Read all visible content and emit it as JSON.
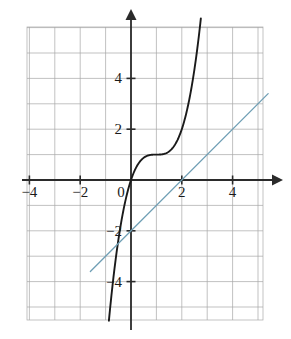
{
  "figure": {
    "title": "",
    "background_color": "#ffffff",
    "grid_color": "#9a9a9a",
    "axis_color": "#2b2b2b",
    "curve_color": "#1a1a1a",
    "line_color": "#6f9fb5"
  },
  "chart_data": {
    "type": "line",
    "title": "",
    "xlabel": "",
    "ylabel": "",
    "xlim": [
      -4.2,
      5.6
    ],
    "ylim": [
      -5.1,
      5.8
    ],
    "grid": true,
    "grid_spacing": 1,
    "legend": "none",
    "x_ticks": [
      -4,
      -2,
      2,
      4
    ],
    "x_tick_labels": [
      "−4",
      "−2",
      "2",
      "4"
    ],
    "y_ticks": [
      -4,
      -2,
      2,
      4
    ],
    "y_tick_labels": [
      "−4",
      "−2",
      "2",
      "4"
    ],
    "origin_label": "0",
    "axis_arrows": [
      "x-positive",
      "y-positive"
    ],
    "series": [
      {
        "name": "cubic-curve",
        "color": "#1a1a1a",
        "type": "curve",
        "equation": "y = (x - 1)^3 + 1",
        "x_domain": [
          -2.6,
          3.3
        ],
        "points": [
          [
            -2.6,
            -45.6
          ],
          [
            -2.4,
            -38.3
          ],
          [
            -2.2,
            -31.8
          ],
          [
            -2.0,
            -26.0
          ],
          [
            -1.8,
            -20.8
          ],
          [
            -1.6,
            -16.3
          ],
          [
            -1.4,
            -12.8
          ],
          [
            -1.2,
            -9.6
          ],
          [
            -1.0,
            -7.0
          ],
          [
            -0.8,
            -4.8
          ],
          [
            -0.6,
            -3.1
          ],
          [
            -0.4,
            -1.7
          ],
          [
            -0.2,
            -0.7
          ],
          [
            0.0,
            0.0
          ],
          [
            0.2,
            0.49
          ],
          [
            0.4,
            0.78
          ],
          [
            0.6,
            0.94
          ],
          [
            0.8,
            0.99
          ],
          [
            1.0,
            1.0
          ],
          [
            1.2,
            1.01
          ],
          [
            1.4,
            1.06
          ],
          [
            1.6,
            1.22
          ],
          [
            1.8,
            1.51
          ],
          [
            2.0,
            2.0
          ],
          [
            2.2,
            2.73
          ],
          [
            2.4,
            3.74
          ],
          [
            2.6,
            5.1
          ],
          [
            2.8,
            6.83
          ],
          [
            3.0,
            9.0
          ],
          [
            3.3,
            13.2
          ]
        ]
      },
      {
        "name": "tangent-line",
        "color": "#6f9fb5",
        "type": "line",
        "equation": "y = x - 2",
        "x_domain": [
          -1.6,
          5.4
        ],
        "points": [
          [
            -1.6,
            -3.6
          ],
          [
            5.4,
            3.4
          ]
        ],
        "y_intercept": -2,
        "x_intercept": 2,
        "slope": 1
      }
    ]
  }
}
